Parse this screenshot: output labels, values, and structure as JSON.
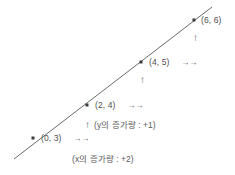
{
  "figure": {
    "type": "coordinate-line-graph",
    "line_color": "#6b6b6b",
    "point_color": "#3a3a3a",
    "text_color": "#4f4f4f",
    "background": "#ffffff"
  },
  "chart_data": {
    "type": "line",
    "title": "",
    "xlabel": "",
    "ylabel": "",
    "x": [
      0,
      2,
      4,
      6
    ],
    "values": [
      3,
      4,
      5,
      6
    ],
    "point_labels": [
      "(0, 3)",
      "(2, 4)",
      "(4, 5)",
      "(6, 6)"
    ],
    "slope": 0.5,
    "intercept": 3,
    "grid": false,
    "legend": false
  },
  "points": [
    {
      "label": "(0, 3)",
      "x": 0,
      "y": 3,
      "px": 33,
      "py": 138,
      "label_x": 41,
      "label_y": 134
    },
    {
      "label": "(2, 4)",
      "x": 2,
      "y": 4,
      "px": 87,
      "py": 105,
      "label_x": 95,
      "label_y": 101
    },
    {
      "label": "(4, 5)",
      "x": 4,
      "y": 5,
      "px": 141,
      "py": 62,
      "label_x": 149,
      "label_y": 58
    },
    {
      "label": "(6, 6)",
      "x": 6,
      "y": 6,
      "px": 194,
      "py": 20,
      "label_x": 201,
      "label_y": 16
    }
  ],
  "horizontal_arrows": [
    {
      "glyph": "→→",
      "x": 73,
      "y": 134,
      "after_point": "(0, 3)"
    },
    {
      "glyph": "→→",
      "x": 127,
      "y": 101,
      "after_point": "(2, 4)"
    },
    {
      "glyph": "→→",
      "x": 181,
      "y": 58,
      "after_point": "(4, 5)"
    }
  ],
  "vertical_arrows": [
    {
      "glyph": "↑",
      "x": 85,
      "y": 120,
      "between": "(0, 3) and (2, 4)"
    },
    {
      "glyph": "↑",
      "x": 140,
      "y": 75,
      "between": "(2, 4) and (4, 5)"
    },
    {
      "glyph": "↑",
      "x": 193,
      "y": 33,
      "between": "(4, 5) and (6, 6)"
    }
  ],
  "annotations": {
    "y_increment": {
      "text": "(y의 증가량 : +1)",
      "x": 94,
      "y": 121
    },
    "x_increment": {
      "text": "(x의 증가량 : +2)",
      "x": 72,
      "y": 155
    }
  },
  "line_segment": {
    "x1": 14,
    "y1": 159,
    "x2": 212,
    "y2": 7
  }
}
